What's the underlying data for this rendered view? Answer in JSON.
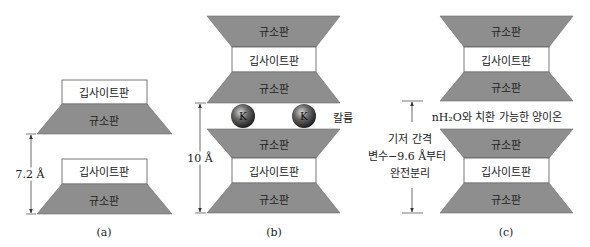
{
  "colors": {
    "silica_fill": "#8e8e8e",
    "silica_stroke": "#6b6b6b",
    "kaolinite_fill": "#ffffff",
    "kaolinite_stroke": "#555555",
    "ion_fill": "#3a3a3a",
    "line": "#444444"
  },
  "labels": {
    "silica_sheet": "규소판",
    "kaolinite_sheet": "깁사이트판"
  },
  "panels": [
    {
      "id": "a",
      "caption": "(a)",
      "spacing_label": "7.2 Å"
    },
    {
      "id": "b",
      "caption": "(b)",
      "spacing_label": "10 Å",
      "ion_symbol": "K",
      "ion_label": "칼륨"
    },
    {
      "id": "c",
      "caption": "(c)",
      "interlayer_label": "nH₂O와 치환 가능한 양이온",
      "spacing_label_lines": [
        "기저 간격",
        "변수−9.6 Å부터",
        "완전분리"
      ]
    }
  ]
}
